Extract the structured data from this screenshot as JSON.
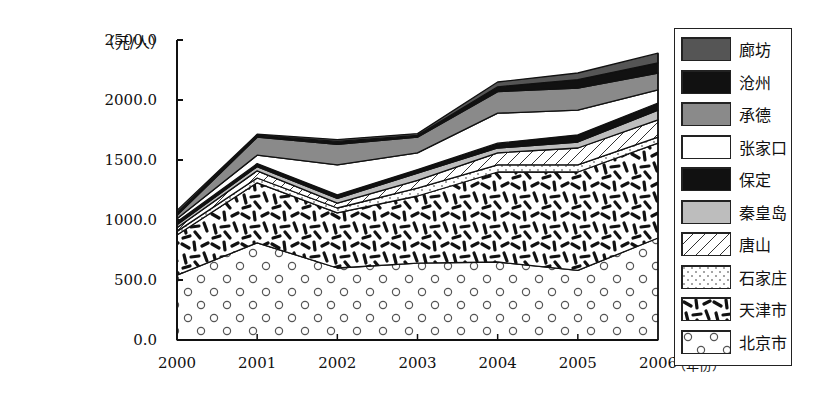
{
  "chart_data": {
    "type": "area",
    "stacked": true,
    "title": "",
    "xlabel": "（年份）",
    "ylabel": "（元/人）",
    "x": [
      "2000",
      "2001",
      "2002",
      "2003",
      "2004",
      "2005",
      "2006"
    ],
    "ylim": [
      0,
      2500
    ],
    "yticks": [
      "0.0",
      "500.0",
      "1000.0",
      "1500.0",
      "2000.0",
      "2500.0"
    ],
    "ytick_values": [
      0,
      500,
      1000,
      1500,
      2000,
      2500
    ],
    "grid": false,
    "legend_position": "right",
    "series": [
      {
        "name": "北京市",
        "pattern": "circles",
        "values": [
          540,
          810,
          600,
          640,
          650,
          580,
          850
        ]
      },
      {
        "name": "天津市",
        "pattern": "dashes",
        "values": [
          335,
          500,
          460,
          560,
          750,
          820,
          790
        ]
      },
      {
        "name": "石家庄",
        "pattern": "dots",
        "values": [
          30,
          40,
          40,
          65,
          60,
          60,
          50
        ]
      },
      {
        "name": "唐山",
        "pattern": "hatch",
        "values": [
          30,
          60,
          40,
          65,
          100,
          140,
          145
        ]
      },
      {
        "name": "秦皇岛",
        "pattern": "light-gray",
        "values": [
          25,
          35,
          40,
          60,
          40,
          50,
          80
        ]
      },
      {
        "name": "保定",
        "pattern": "black",
        "values": [
          25,
          25,
          30,
          30,
          40,
          60,
          60
        ]
      },
      {
        "name": "张家口",
        "pattern": "white",
        "values": [
          25,
          70,
          250,
          140,
          250,
          205,
          110
        ]
      },
      {
        "name": "承德",
        "pattern": "mid-gray",
        "values": [
          30,
          150,
          170,
          130,
          180,
          185,
          140
        ]
      },
      {
        "name": "沧州",
        "pattern": "black",
        "values": [
          20,
          15,
          25,
          15,
          40,
          70,
          85
        ]
      },
      {
        "name": "廊坊",
        "pattern": "dark-gray",
        "values": [
          20,
          10,
          15,
          15,
          40,
          55,
          80
        ]
      }
    ],
    "legend_order": [
      "廊坊",
      "沧州",
      "承德",
      "张家口",
      "保定",
      "秦皇岛",
      "唐山",
      "石家庄",
      "天津市",
      "北京市"
    ]
  },
  "colors": {
    "black": "#111111",
    "dark-gray": "#555555",
    "mid-gray": "#8a8a8a",
    "light-gray": "#bdbdbd",
    "white": "#ffffff"
  }
}
